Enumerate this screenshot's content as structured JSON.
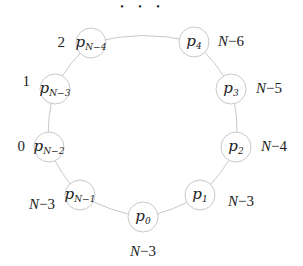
{
  "diagram": {
    "type": "ring",
    "ellipsis": "• • •",
    "nodes": [
      {
        "id": "pN-4",
        "base": "p",
        "sub": "N−4",
        "cx": 91,
        "cy": 43,
        "label": "2",
        "lx": 65,
        "ly": 47,
        "anchor": "end"
      },
      {
        "id": "p4",
        "base": "p",
        "sub": "4",
        "cx": 194,
        "cy": 42,
        "label": "N−6",
        "lx": 218,
        "ly": 46,
        "anchor": "start"
      },
      {
        "id": "p3",
        "base": "p",
        "sub": "3",
        "cx": 231,
        "cy": 89,
        "label": "N−5",
        "lx": 256,
        "ly": 93,
        "anchor": "start"
      },
      {
        "id": "p2",
        "base": "p",
        "sub": "2",
        "cx": 236,
        "cy": 147,
        "label": "N−4",
        "lx": 261,
        "ly": 151,
        "anchor": "start"
      },
      {
        "id": "p1",
        "base": "p",
        "sub": "1",
        "cx": 200,
        "cy": 195,
        "label": "N−3",
        "lx": 228,
        "ly": 206,
        "anchor": "start"
      },
      {
        "id": "p0",
        "base": "p",
        "sub": "0",
        "cx": 143,
        "cy": 217,
        "label": "N−3",
        "lx": 143,
        "ly": 256,
        "anchor": "middle"
      },
      {
        "id": "pN-1",
        "base": "p",
        "sub": "N−1",
        "cx": 80,
        "cy": 195,
        "label": "N−3",
        "lx": 55,
        "ly": 209,
        "anchor": "end"
      },
      {
        "id": "pN-2",
        "base": "p",
        "sub": "N−2",
        "cx": 49,
        "cy": 147,
        "label": "0",
        "lx": 25,
        "ly": 151,
        "anchor": "end"
      },
      {
        "id": "pN-3",
        "base": "p",
        "sub": "N−3",
        "cx": 55,
        "cy": 89,
        "label": "1",
        "lx": 30,
        "ly": 86,
        "anchor": "end"
      }
    ],
    "radius": 15
  }
}
